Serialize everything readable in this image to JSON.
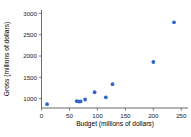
{
  "chart_data": {
    "type": "scatter",
    "title": "",
    "xlabel": "Budget (millions of dollars)",
    "ylabel": "Gross (millions of dollars)",
    "xlim": [
      0,
      262
    ],
    "ylim": [
      780,
      3080
    ],
    "xticks": [
      0,
      50,
      100,
      150,
      200,
      250
    ],
    "xtick_labels": [
      "0",
      "50",
      "100",
      "150",
      "200",
      "250"
    ],
    "yticks": [
      1000,
      1500,
      2000,
      2500,
      3000
    ],
    "ytick_labels": [
      "1000",
      "1500",
      "2000",
      "2500",
      "3000"
    ],
    "grid": false,
    "legend": null,
    "marker_color": "#3366CC",
    "marker_shape": "circle",
    "axis_color": "#595959",
    "points": [
      {
        "x": 10,
        "y": 870
      },
      {
        "x": 63,
        "y": 940
      },
      {
        "x": 67,
        "y": 930
      },
      {
        "x": 70,
        "y": 935
      },
      {
        "x": 78,
        "y": 980
      },
      {
        "x": 95,
        "y": 1150
      },
      {
        "x": 115,
        "y": 1030
      },
      {
        "x": 127,
        "y": 1340
      },
      {
        "x": 200,
        "y": 1860
      },
      {
        "x": 237,
        "y": 2790
      }
    ]
  }
}
